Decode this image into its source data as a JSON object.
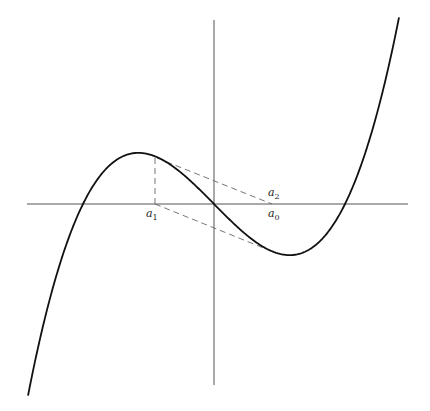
{
  "diagram": {
    "axes": {
      "origin": [
        214,
        204
      ],
      "x_range": [
        27,
        408
      ],
      "y_range": [
        20,
        385
      ],
      "color": "#555555"
    },
    "curve": {
      "roots_px": [
        83,
        214,
        345
      ],
      "k": 5.91e-05,
      "x_start": 28,
      "x_end": 399,
      "color": "#111111"
    },
    "dashed_lines": [
      {
        "from": [
          155,
          158
        ],
        "to": [
          155,
          204
        ]
      },
      {
        "from": [
          157,
          158
        ],
        "to": [
          272,
          204
        ]
      },
      {
        "from": [
          155,
          204
        ],
        "to": [
          266,
          249
        ]
      }
    ],
    "labels": [
      {
        "base": "a",
        "sub": "1",
        "x": 146,
        "y": 207
      },
      {
        "base": "a",
        "sub": "0",
        "x": 268,
        "y": 207
      },
      {
        "base": "a",
        "sub": "2",
        "x": 268,
        "y": 186
      }
    ]
  }
}
